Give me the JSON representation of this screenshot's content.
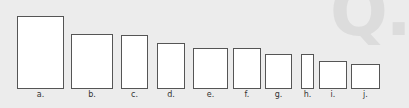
{
  "watermark": "Q.",
  "colors": {
    "background": "#ececec",
    "rect_fill": "#ffffff",
    "rect_border": "#555555"
  },
  "rectangles": [
    {
      "label": "a.",
      "x": 17,
      "y": 16,
      "w": 47,
      "h": 73
    },
    {
      "label": "b.",
      "x": 71,
      "y": 34,
      "w": 42,
      "h": 55
    },
    {
      "label": "c.",
      "x": 121,
      "y": 35,
      "w": 27,
      "h": 54
    },
    {
      "label": "d.",
      "x": 157,
      "y": 43,
      "w": 28,
      "h": 46
    },
    {
      "label": "e.",
      "x": 193,
      "y": 48,
      "w": 35,
      "h": 41
    },
    {
      "label": "f.",
      "x": 233,
      "y": 48,
      "w": 28,
      "h": 41
    },
    {
      "label": "g.",
      "x": 265,
      "y": 54,
      "w": 27,
      "h": 35
    },
    {
      "label": "h.",
      "x": 301,
      "y": 54,
      "w": 13,
      "h": 35
    },
    {
      "label": "i.",
      "x": 319,
      "y": 61,
      "w": 28,
      "h": 28
    },
    {
      "label": "j.",
      "x": 351,
      "y": 64,
      "w": 29,
      "h": 25
    }
  ]
}
